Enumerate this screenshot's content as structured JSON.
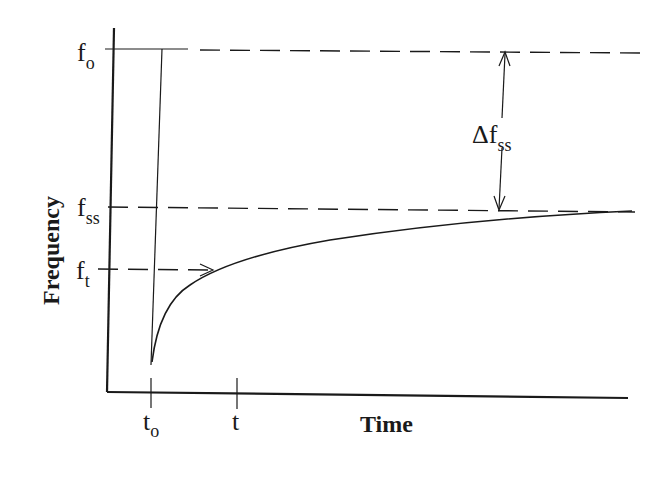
{
  "diagram": {
    "xlabel": "Time",
    "ylabel": "Frequency",
    "y_levels": {
      "f_o": {
        "base": "f",
        "sub": "o"
      },
      "f_ss": {
        "base": "f",
        "sub": "ss"
      },
      "f_t": {
        "base": "f",
        "sub": "t"
      }
    },
    "x_ticks": {
      "t_o": {
        "base": "t",
        "sub": "o"
      },
      "t": {
        "base": "t",
        "sub": ""
      }
    },
    "annotation": {
      "prefix": "Δf",
      "sub": "ss"
    },
    "colors": {
      "ink": "#1a1a1a",
      "background": "#ffffff"
    }
  }
}
